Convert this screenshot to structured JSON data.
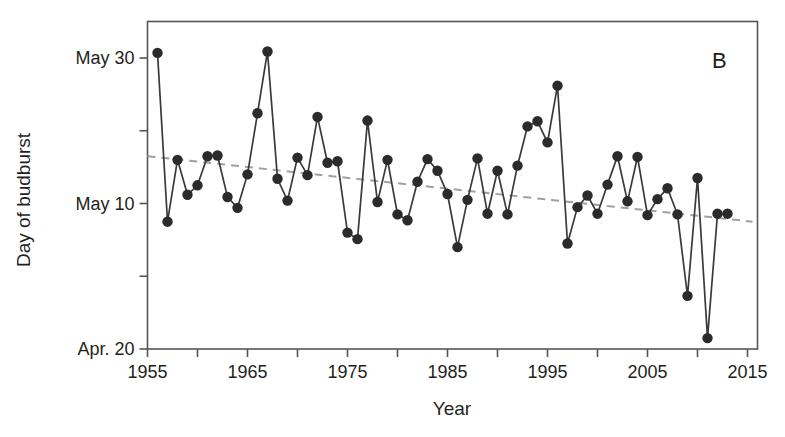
{
  "chart_data": {
    "type": "line",
    "title": "",
    "panel_label": "B",
    "xlabel": "Year",
    "ylabel": "Day of budburst",
    "xlim": [
      1955,
      2016
    ],
    "ylim_days": [
      110,
      150
    ],
    "ylim_labels": [
      "Apr. 20",
      "May 30"
    ],
    "grid": false,
    "legend": "none",
    "x_ticks": [
      1955,
      1960,
      1965,
      1970,
      1975,
      1980,
      1985,
      1990,
      1995,
      2000,
      2005,
      2010,
      2015
    ],
    "x_tick_labels": [
      "1955",
      "",
      "1965",
      "",
      "1975",
      "",
      "1985",
      "",
      "1995",
      "",
      "2005",
      "",
      "2015"
    ],
    "x_major_labeled": [
      1955,
      1965,
      1975,
      1985,
      1995,
      2005,
      2015
    ],
    "y_ticks_days": [
      110,
      120,
      130,
      140,
      150
    ],
    "y_tick_labels": [
      "Apr. 20",
      "",
      "May 10",
      "",
      "May 30"
    ],
    "day_reference": {
      "Apr. 20": 110,
      "Apr. 30": 120,
      "May 10": 130,
      "May 20": 140,
      "May 30": 150
    },
    "marker": "filled-circle",
    "marker_color": "#2b2b2b",
    "line_color": "#3a3a3a",
    "trend_color": "#9b9b9b",
    "trend_style": "dashed",
    "trendline": {
      "x_start": 1955,
      "y_start_day": 136.5,
      "x_end": 2015.5,
      "y_end_day": 127.5
    },
    "x": [
      1956,
      1957,
      1958,
      1959,
      1960,
      1961,
      1962,
      1963,
      1964,
      1965,
      1966,
      1967,
      1968,
      1969,
      1970,
      1971,
      1972,
      1973,
      1974,
      1975,
      1976,
      1977,
      1978,
      1979,
      1980,
      1981,
      1982,
      1983,
      1984,
      1985,
      1986,
      1987,
      1988,
      1989,
      1990,
      1991,
      1992,
      1993,
      1994,
      1995,
      1996,
      1997,
      1998,
      1999,
      2000,
      2001,
      2002,
      2003,
      2004,
      2005,
      2006,
      2007,
      2008,
      2009,
      2010,
      2011,
      2012,
      2013
    ],
    "values": [
      150.7,
      127.5,
      136.0,
      131.2,
      132.5,
      136.5,
      136.6,
      130.9,
      129.4,
      134.0,
      142.4,
      150.9,
      133.4,
      130.4,
      136.3,
      133.9,
      141.9,
      135.6,
      135.8,
      126.0,
      125.1,
      141.4,
      130.2,
      136.0,
      128.5,
      127.7,
      133.0,
      136.1,
      134.5,
      131.3,
      124.0,
      130.5,
      136.2,
      128.6,
      134.5,
      128.5,
      135.2,
      140.6,
      141.3,
      138.4,
      146.2,
      124.5,
      129.5,
      131.1,
      128.6,
      132.6,
      136.5,
      130.3,
      136.4,
      128.4,
      130.6,
      132.1,
      128.5,
      117.3,
      133.5,
      111.5,
      128.6,
      128.6
    ]
  },
  "axes": {
    "ylabel": "Day of budburst",
    "xlabel": "Year",
    "panel": "B"
  }
}
